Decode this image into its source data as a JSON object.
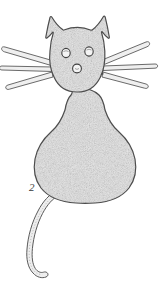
{
  "figure": {
    "label": "2",
    "subject_name": "cat-shaped-organism",
    "caption": "",
    "background_color": "#ffffff",
    "outline_color": "#4a4a4a",
    "fill_color": "#e8e8e8",
    "stipple_color": "#9a9a9a",
    "label_color": "#3a3a3a",
    "style": "stippled-ink-line-drawing"
  },
  "diagram_parts": {
    "ears": [
      {
        "name": "left-ear",
        "side": "left"
      },
      {
        "name": "right-ear",
        "side": "right"
      }
    ],
    "head": {
      "name": "head",
      "shape": "rounded"
    },
    "eyes": [
      {
        "name": "left-eye",
        "cx": 66,
        "cy": 53,
        "r": 4
      },
      {
        "name": "right-eye",
        "cx": 89,
        "cy": 51,
        "r": 4
      }
    ],
    "nose": {
      "name": "nose",
      "cx": 77,
      "cy": 68,
      "r": 4
    },
    "neck": {
      "name": "neck"
    },
    "body": {
      "name": "body",
      "shape": "pear"
    },
    "whiskers_left": [
      {
        "name": "left-whisker-upper"
      },
      {
        "name": "left-whisker-middle"
      },
      {
        "name": "left-whisker-lower"
      }
    ],
    "whiskers_right": [
      {
        "name": "right-whisker-upper"
      },
      {
        "name": "right-whisker-middle"
      },
      {
        "name": "right-whisker-lower"
      }
    ],
    "tail": {
      "name": "tail",
      "curve": "s-curve-down-left"
    }
  }
}
